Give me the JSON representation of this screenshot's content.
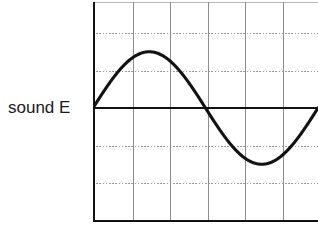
{
  "figure": {
    "label": "sound E",
    "label_name": "sound-e-label"
  },
  "colors": {
    "background": "#ffffff",
    "waveform": "#121212",
    "axis": "#121212",
    "gridline_vertical": "#8c8c8c",
    "gridline_horizontal": "#9a9a9a",
    "border_top": "#b8b8b8",
    "text": "#1a1a1a"
  },
  "chart_data": {
    "type": "line",
    "title": "sound E",
    "subtitle": "",
    "xlabel": "",
    "ylabel": "",
    "grid": true,
    "grid_style": {
      "vertical": "solid",
      "horizontal": "dotted"
    },
    "legend": "none",
    "legend_position": "left-outside",
    "annotations": [
      {
        "text": "sound E",
        "position": "left of plot, at zero-amplitude baseline"
      }
    ],
    "axis": {
      "zero_line": 0,
      "zero_line_emphasis": "bold black horizontal axis through middle",
      "left_axis_emphasis": "bold black vertical axis",
      "bottom_border_emphasis": "bold black horizontal border"
    },
    "xlim": [
      0,
      6
    ],
    "ylim": [
      -2.9,
      2.9
    ],
    "x_tick_values": [
      0,
      1,
      2,
      3,
      4,
      5,
      6
    ],
    "x_tick_labels": [
      "",
      "",
      "",
      "",
      "",
      "",
      ""
    ],
    "y_tick_values": [
      -2.9,
      -2,
      -1,
      0,
      1,
      2,
      2.9
    ],
    "y_tick_labels": [
      "",
      "",
      "",
      "",
      "",
      "",
      ""
    ],
    "series": [
      {
        "name": "sound E",
        "waveform": "sine",
        "cycles": 1,
        "amplitude": 1.5,
        "period": 6,
        "phase": 0,
        "x": [
          0,
          0.25,
          0.5,
          0.75,
          1,
          1.25,
          1.5,
          1.75,
          2,
          2.25,
          2.5,
          2.75,
          3,
          3.25,
          3.5,
          3.75,
          4,
          4.25,
          4.5,
          4.75,
          5,
          5.25,
          5.5,
          5.75,
          6
        ],
        "values": [
          0,
          0.388,
          0.75,
          1.061,
          1.299,
          1.449,
          1.5,
          1.449,
          1.299,
          1.061,
          0.75,
          0.388,
          0,
          -0.388,
          -0.75,
          -1.061,
          -1.299,
          -1.449,
          -1.5,
          -1.449,
          -1.299,
          -1.061,
          -0.75,
          -0.388,
          0
        ]
      }
    ],
    "key_points": {
      "start": {
        "x": 0,
        "y": 0
      },
      "peak": {
        "x": 1.5,
        "y": 1.5
      },
      "zero_crossing": {
        "x": 3,
        "y": 0
      },
      "trough": {
        "x": 4.5,
        "y": -1.5
      },
      "end": {
        "x": 6,
        "y": 0
      }
    }
  },
  "geometry": {
    "plot_left": 93,
    "plot_top": 2,
    "plot_width": 225,
    "plot_height": 220,
    "baseline_y": 106,
    "grid_columns": 6,
    "grid_rows": 6,
    "column_spacing": 37.5,
    "row_spacing": 37.5
  }
}
